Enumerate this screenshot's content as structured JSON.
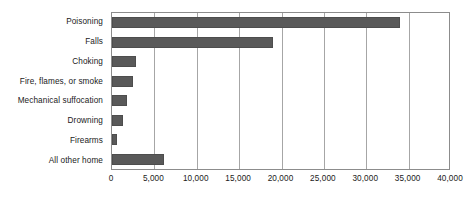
{
  "chart_data": {
    "type": "bar",
    "orientation": "horizontal",
    "title": "",
    "subtitle": "",
    "xlabel": "",
    "ylabel": "",
    "categories": [
      "Poisoning",
      "Falls",
      "Choking",
      "Fire, flames, or smoke",
      "Mechanical suffocation",
      "Drowning",
      "Firearms",
      "All other home"
    ],
    "values": [
      34000,
      19000,
      2800,
      2500,
      1800,
      1300,
      600,
      6100
    ],
    "xlim": [
      0,
      40000
    ],
    "xticks": [
      0,
      5000,
      10000,
      15000,
      20000,
      25000,
      30000,
      35000,
      40000
    ],
    "xtick_labels": [
      "0",
      "5,000",
      "10,000",
      "15,000",
      "20,000",
      "25,000",
      "30,000",
      "35,000",
      "40,000"
    ],
    "grid": "vertical",
    "legend": "none",
    "bar_color": "#595959",
    "gridline_color": "#a6a6a6",
    "axis_color": "#8c8c8c",
    "text_color": "#1a1a1a",
    "background_color": "#ffffff"
  }
}
